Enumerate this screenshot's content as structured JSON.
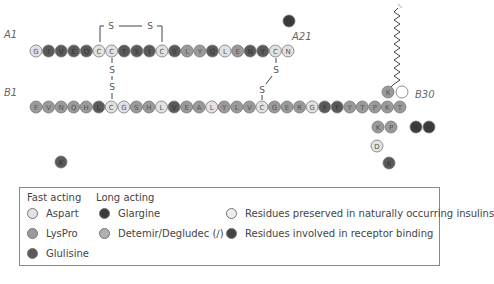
{
  "labels": {
    "a_start": "A1",
    "a_end": "A21",
    "b_start": "B1",
    "b_end": "B30",
    "sulfur": "S"
  },
  "colors": {
    "light": "#e2e2e2",
    "medium": "#9a9a9a",
    "dark": "#5a5a5a",
    "darkest": "#3c3c3c",
    "stroke": "#777777"
  },
  "a_chain": {
    "sequence": [
      "G",
      "I",
      "V",
      "E",
      "Q",
      "C",
      "C",
      "T",
      "S",
      "I",
      "C",
      "S",
      "L",
      "Y",
      "Q",
      "L",
      "E",
      "N",
      "Y",
      "C",
      "N"
    ],
    "shades": [
      "light",
      "dark",
      "dark",
      "dark",
      "dark",
      "light",
      "light",
      "dark",
      "dark",
      "dark",
      "light",
      "dark",
      "medium",
      "medium",
      "dark",
      "light",
      "medium",
      "dark",
      "dark",
      "light",
      "light"
    ]
  },
  "b_chain": {
    "sequence": [
      "F",
      "V",
      "N",
      "Q",
      "H",
      "L",
      "C",
      "G",
      "S",
      "H",
      "L",
      "V",
      "E",
      "A",
      "L",
      "Y",
      "L",
      "V",
      "C",
      "G",
      "E",
      "R",
      "G",
      "F",
      "F",
      "Y",
      "T",
      "P",
      "K",
      "T"
    ],
    "shades": [
      "medium",
      "medium",
      "medium",
      "medium",
      "medium",
      "dark",
      "light",
      "light",
      "medium",
      "medium",
      "light",
      "dark",
      "medium",
      "medium",
      "light",
      "medium",
      "medium",
      "medium",
      "light",
      "medium",
      "medium",
      "medium",
      "light",
      "dark",
      "dark",
      "medium",
      "medium",
      "medium",
      "medium",
      "medium"
    ]
  },
  "modifications": {
    "glargine_a21_extra": {
      "label": "G",
      "shade": "darkest"
    },
    "glargine_b31_b32": [
      {
        "label": "R",
        "shade": "darkest"
      },
      {
        "label": "R",
        "shade": "darkest"
      }
    ],
    "lyspro_kp": [
      {
        "label": "K",
        "shade": "medium"
      },
      {
        "label": "P",
        "shade": "medium"
      }
    ],
    "aspart_d": {
      "label": "D",
      "shade": "light"
    },
    "glulisine_k": {
      "label": "K",
      "shade": "dark"
    },
    "glulisine_n": {
      "label": "K",
      "shade": "dark"
    },
    "detemir_k": {
      "label": "K",
      "shade": "medium"
    },
    "detemir_deleted": {
      "label": "",
      "shade": "white"
    }
  },
  "legend": {
    "fast_acting_header": "Fast acting",
    "long_acting_header": "Long acting",
    "fast_items": [
      {
        "label": "Aspart",
        "color": "#e2e2e2"
      },
      {
        "label": "LysPro",
        "color": "#9a9a9a"
      },
      {
        "label": "Glulisine",
        "color": "#5a5a5a"
      }
    ],
    "long_items": [
      {
        "label": "Glargine",
        "color": "#3c3c3c"
      },
      {
        "label": "Detemir/Degludec (∕)",
        "color": "#b0b0b0"
      }
    ],
    "other_items": [
      {
        "label": "Residues preserved in naturally occurring insulins",
        "color": "#eeeeee"
      },
      {
        "label": "Residues involved in receptor binding",
        "color": "#444444"
      }
    ]
  }
}
